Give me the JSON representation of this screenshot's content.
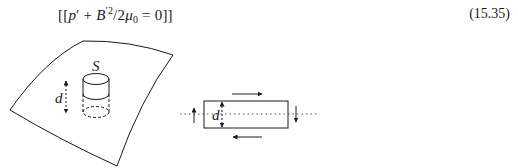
{
  "equation": {
    "open": "[[",
    "p": "p",
    "prime1": "′",
    "plus": " + ",
    "B": "B",
    "prime2": "′",
    "sq": "2",
    "slash": "/2",
    "mu": "μ",
    "mu_sub": "0",
    "eq": " = 0",
    "close": "]]",
    "number": "(15.35)"
  },
  "figure_left": {
    "surface_label": "S",
    "height_label": "d"
  },
  "figure_right": {
    "height_label": "d"
  },
  "colors": {
    "ink": "#1a1a1a",
    "dotted": "#555555"
  }
}
